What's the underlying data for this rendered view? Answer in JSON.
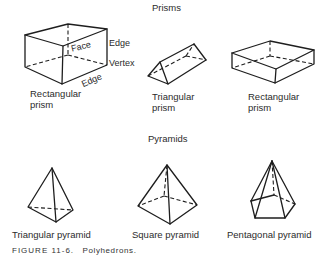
{
  "figure": {
    "caption_label": "FIGURE 11-6.",
    "caption_text": "Polyhedrons."
  },
  "sections": {
    "prisms_title": "Prisms",
    "pyramids_title": "Pyramids"
  },
  "prisms": [
    {
      "label_line1": "Rectangular",
      "label_line2": "prism",
      "annotations": {
        "face": "Face",
        "edge_right": "Edge",
        "vertex": "Vertex",
        "edge_bottom": "Edge"
      }
    },
    {
      "label_line1": "Triangular",
      "label_line2": "prism"
    },
    {
      "label_line1": "Rectangular",
      "label_line2": "prism"
    }
  ],
  "pyramids": [
    {
      "label": "Triangular pyramid"
    },
    {
      "label": "Square pyramid"
    },
    {
      "label": "Pentagonal pyramid"
    }
  ],
  "colors": {
    "line": "#1e1e1e",
    "text": "#2b2b2b",
    "background": "#ffffff"
  }
}
